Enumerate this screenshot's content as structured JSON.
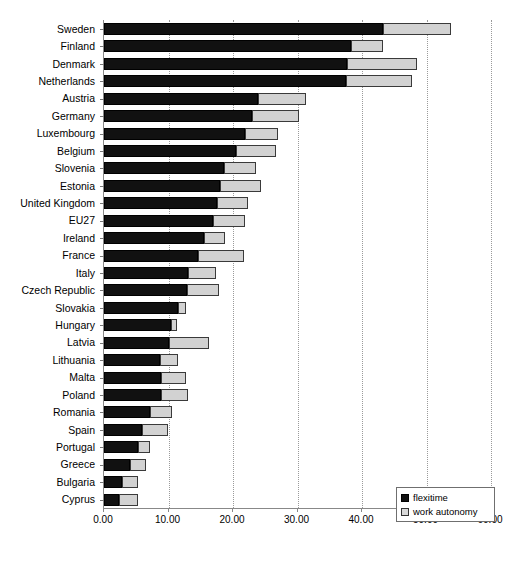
{
  "chart_data": {
    "type": "bar",
    "orientation": "horizontal",
    "stacked": true,
    "title": "",
    "xlabel": "",
    "ylabel": "",
    "xlim": [
      0,
      60
    ],
    "xticks": [
      "0.00",
      "10.00",
      "20.00",
      "30.00",
      "40.00",
      "50.00",
      "60.00"
    ],
    "xtick_values": [
      0,
      10,
      20,
      30,
      40,
      50,
      60
    ],
    "grid": "vertical-dotted",
    "legend_position": "bottom-right",
    "categories": [
      "Sweden",
      "Finland",
      "Denmark",
      "Netherlands",
      "Austria",
      "Germany",
      "Luxembourg",
      "Belgium",
      "Slovenia",
      "Estonia",
      "United Kingdom",
      "EU27",
      "Ireland",
      "France",
      "Italy",
      "Czech Republic",
      "Slovakia",
      "Hungary",
      "Latvia",
      "Lithuania",
      "Malta",
      "Poland",
      "Romania",
      "Spain",
      "Portugal",
      "Greece",
      "Bulgaria",
      "Cyprus"
    ],
    "series": [
      {
        "name": "flexitime",
        "color": "#111111",
        "values": [
          43.3,
          38.3,
          37.7,
          37.5,
          23.9,
          23.0,
          21.9,
          20.5,
          18.6,
          18.0,
          17.5,
          16.9,
          15.5,
          14.6,
          13.0,
          12.9,
          11.5,
          10.4,
          10.1,
          8.7,
          8.8,
          8.8,
          7.1,
          5.9,
          5.3,
          4.0,
          2.8,
          2.3
        ]
      },
      {
        "name": "work autonomy",
        "color": "#d2d2d2",
        "values": [
          10.5,
          4.9,
          10.9,
          10.2,
          7.4,
          7.3,
          5.1,
          6.2,
          4.9,
          6.4,
          4.8,
          4.9,
          3.3,
          7.1,
          4.3,
          4.9,
          1.2,
          0.9,
          6.2,
          2.8,
          3.9,
          4.2,
          3.4,
          4.1,
          1.9,
          2.5,
          2.4,
          2.9
        ]
      }
    ],
    "totals": [
      53.8,
      43.2,
      48.6,
      47.7,
      31.3,
      30.3,
      27.0,
      26.7,
      23.5,
      24.4,
      22.3,
      21.8,
      18.8,
      21.7,
      17.3,
      17.8,
      12.7,
      11.3,
      16.3,
      11.5,
      12.7,
      13.0,
      10.5,
      10.0,
      7.2,
      6.5,
      5.2,
      5.2
    ]
  },
  "legend": {
    "items": [
      {
        "label": "flexitime",
        "swatch": "black-square-icon"
      },
      {
        "label": "work autonomy",
        "swatch": "grey-square-icon"
      }
    ]
  }
}
